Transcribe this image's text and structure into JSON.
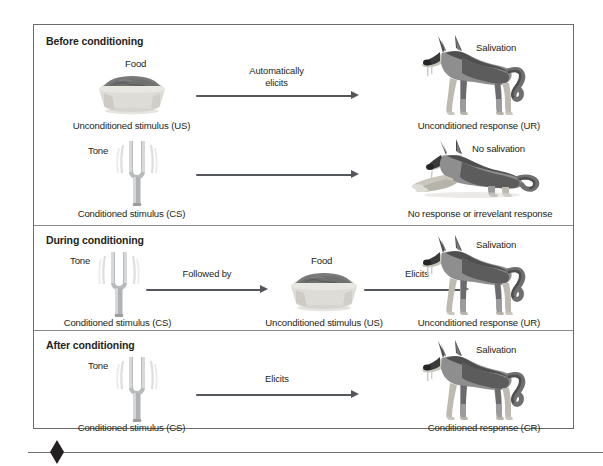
{
  "figure": {
    "bottom_marker": "diamond-marker"
  },
  "panels": [
    {
      "title": "Before conditioning",
      "rows": [
        {
          "stimulus_top_label": "Food",
          "stimulus_icon": "food-bowl-icon",
          "stimulus_caption": "Unconditioned stimulus (US)",
          "arrow_label": "Automatically\nelicits",
          "arrow_label_line1": "Automatically",
          "arrow_label_line2": "elicits",
          "response_top_label": "Salivation",
          "response_icon": "dog-standing-salivating-icon",
          "response_caption": "Unconditioned response (UR)"
        },
        {
          "stimulus_top_label": "Tone",
          "stimulus_icon": "tuning-fork-icon",
          "stimulus_caption": "Conditioned stimulus (CS)",
          "arrow_label": "",
          "arrow_label_line1": "",
          "arrow_label_line2": "",
          "response_top_label": "No salivation",
          "response_icon": "dog-lying-icon",
          "response_caption": "No response or irrevelant response"
        }
      ]
    },
    {
      "title": "During conditioning",
      "rows": [
        {
          "stimulus_top_label": "Tone",
          "stimulus_icon": "tuning-fork-icon",
          "stimulus_caption": "Conditioned stimulus (CS)",
          "arrow_label_line1": "Followed by",
          "arrow_label_line2": "",
          "middle_top_label": "Food",
          "middle_icon": "food-bowl-icon",
          "middle_caption": "Unconditioned stimulus (US)",
          "arrow2_label_line1": "Elicits",
          "response_top_label": "Salivation",
          "response_icon": "dog-standing-salivating-icon",
          "response_caption": "Unconditioned response (UR)"
        }
      ]
    },
    {
      "title": "After conditioning",
      "rows": [
        {
          "stimulus_top_label": "Tone",
          "stimulus_icon": "tuning-fork-icon",
          "stimulus_caption": "Conditioned stimulus (CS)",
          "arrow_label_line1": "Elicits",
          "arrow_label_line2": "",
          "response_top_label": "Salivation",
          "response_icon": "dog-standing-salivating-icon",
          "response_caption": "Conditioned response (CR)"
        }
      ]
    }
  ],
  "colors": {
    "frame_border": "#6b6b6b",
    "divider": "#8a8a8a",
    "arrow": "#53565a",
    "text": "#231f20",
    "bowl_light": "#d8d8d6",
    "bowl_food": "#6f7070",
    "fork_metal": "#a9abad",
    "dog_dark": "#4f4f4f",
    "dog_mid": "#8e8e8e",
    "dog_light": "#c9c6bd",
    "background": "#ffffff"
  }
}
